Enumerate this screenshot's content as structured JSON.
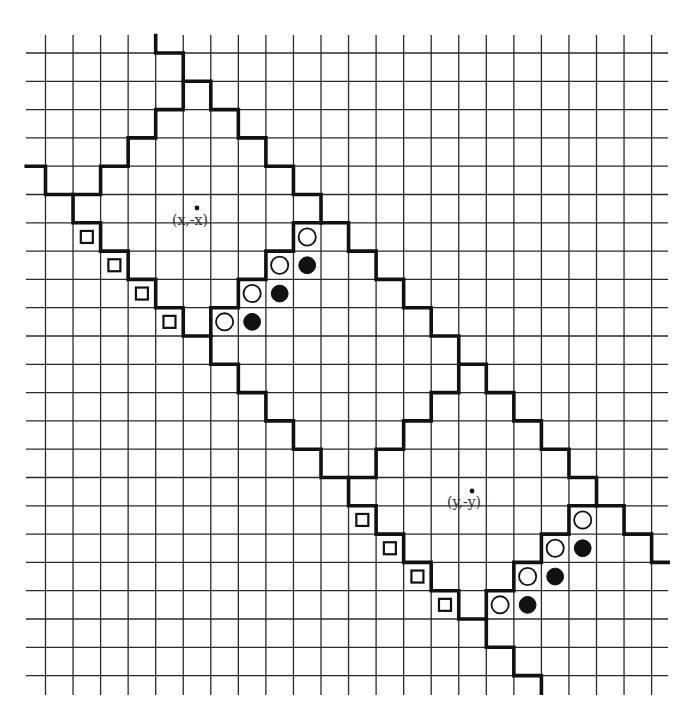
{
  "figure": {
    "colors": {
      "background": "#ffffff",
      "grid": "#2a2a2a",
      "ink": "#111111",
      "label": "#333333"
    },
    "grid": {
      "cols": 23,
      "rows": 23,
      "x0": 45.5,
      "dx": 27.55,
      "y0": 53,
      "dy": 28.3,
      "vertical_line_top": 35,
      "vertical_line_bottom": 695,
      "horizontal_line_left": 26,
      "horizontal_line_right": 668
    },
    "labels": [
      {
        "id": "label-x",
        "text": "(x,-x)",
        "x": 172,
        "y": 225,
        "dot_x": 197,
        "dot_y": 208
      },
      {
        "id": "label-y",
        "text": "(y,-y)",
        "x": 447,
        "y": 507,
        "dot_x": 472,
        "dot_y": 491
      }
    ],
    "thick_paths": [
      {
        "id": "upper-main-staircase",
        "points": [
          [
            4,
            -0.62
          ],
          [
            4,
            0
          ],
          [
            5,
            0
          ],
          [
            5,
            1
          ],
          [
            6,
            1
          ],
          [
            6,
            2
          ],
          [
            7,
            2
          ],
          [
            7,
            3
          ],
          [
            8,
            3
          ],
          [
            8,
            4
          ],
          [
            9,
            4
          ],
          [
            9,
            5
          ],
          [
            10,
            5
          ],
          [
            10,
            6
          ],
          [
            11,
            6
          ],
          [
            11,
            7
          ],
          [
            12,
            7
          ],
          [
            12,
            8
          ],
          [
            13,
            8
          ],
          [
            13,
            9
          ],
          [
            14,
            9
          ],
          [
            14,
            10
          ],
          [
            15,
            10
          ],
          [
            15,
            11
          ],
          [
            16,
            11
          ],
          [
            16,
            12
          ],
          [
            17,
            12
          ],
          [
            17,
            13
          ],
          [
            18,
            13
          ],
          [
            18,
            14
          ],
          [
            19,
            14
          ],
          [
            19,
            15
          ],
          [
            20,
            15
          ],
          [
            20,
            16
          ],
          [
            21,
            16
          ],
          [
            21,
            17
          ],
          [
            22,
            17
          ],
          [
            22,
            18
          ],
          [
            22.6,
            18
          ]
        ]
      },
      {
        "id": "upper-diamond-left-inner",
        "points": [
          [
            5,
            1
          ],
          [
            5,
            2
          ],
          [
            4,
            2
          ],
          [
            4,
            3
          ],
          [
            3,
            3
          ],
          [
            3,
            4
          ],
          [
            2,
            4
          ],
          [
            2,
            5
          ],
          [
            1,
            5
          ]
        ]
      },
      {
        "id": "lower-main-staircase",
        "points": [
          [
            -0.7,
            4
          ],
          [
            0,
            4
          ],
          [
            0,
            5
          ],
          [
            1,
            5
          ],
          [
            1,
            6
          ],
          [
            2,
            6
          ],
          [
            2,
            7
          ],
          [
            3,
            7
          ],
          [
            3,
            8
          ],
          [
            4,
            8
          ],
          [
            4,
            9
          ],
          [
            5,
            9
          ],
          [
            5,
            10
          ],
          [
            6,
            10
          ],
          [
            6,
            11
          ],
          [
            7,
            11
          ],
          [
            7,
            12
          ],
          [
            8,
            12
          ],
          [
            8,
            13
          ],
          [
            9,
            13
          ],
          [
            9,
            14
          ],
          [
            10,
            14
          ],
          [
            10,
            15
          ],
          [
            11,
            15
          ],
          [
            11,
            16
          ],
          [
            12,
            16
          ],
          [
            12,
            17
          ],
          [
            13,
            17
          ],
          [
            13,
            18
          ],
          [
            14,
            18
          ],
          [
            14,
            19
          ],
          [
            15,
            19
          ],
          [
            15,
            20
          ],
          [
            16,
            20
          ],
          [
            16,
            21
          ],
          [
            17,
            21
          ],
          [
            17,
            22
          ],
          [
            18,
            22
          ],
          [
            18,
            22.62
          ]
        ]
      },
      {
        "id": "upper-diamond-right-inner",
        "points": [
          [
            10,
            6
          ],
          [
            9,
            6
          ],
          [
            9,
            7
          ],
          [
            8,
            7
          ],
          [
            8,
            8
          ],
          [
            7,
            8
          ],
          [
            7,
            9
          ],
          [
            6,
            9
          ],
          [
            6,
            10
          ]
        ]
      },
      {
        "id": "lower-diamond-left-inner",
        "points": [
          [
            15,
            11
          ],
          [
            15,
            12
          ],
          [
            14,
            12
          ],
          [
            14,
            13
          ],
          [
            13,
            13
          ],
          [
            13,
            14
          ],
          [
            12,
            14
          ],
          [
            12,
            15
          ],
          [
            11,
            15
          ]
        ]
      },
      {
        "id": "lower-diamond-right-inner",
        "points": [
          [
            20,
            16
          ],
          [
            19,
            16
          ],
          [
            19,
            17
          ],
          [
            18,
            17
          ],
          [
            18,
            18
          ],
          [
            17,
            18
          ],
          [
            17,
            19
          ],
          [
            16,
            19
          ],
          [
            16,
            20
          ]
        ]
      }
    ],
    "markers": {
      "squares": [
        [
          1,
          6
        ],
        [
          2,
          7
        ],
        [
          3,
          8
        ],
        [
          4,
          9
        ],
        [
          11,
          16
        ],
        [
          12,
          17
        ],
        [
          13,
          18
        ],
        [
          14,
          19
        ]
      ],
      "open_circles": [
        [
          9,
          6
        ],
        [
          8,
          7
        ],
        [
          7,
          8
        ],
        [
          6,
          9
        ],
        [
          19,
          16
        ],
        [
          18,
          17
        ],
        [
          17,
          18
        ],
        [
          16,
          19
        ]
      ],
      "filled_circles": [
        [
          9,
          7
        ],
        [
          8,
          8
        ],
        [
          7,
          9
        ],
        [
          19,
          17
        ],
        [
          18,
          18
        ],
        [
          17,
          19
        ]
      ]
    },
    "marker_sizes": {
      "square": 12,
      "open_circle_r": 8.6,
      "filled_circle_r": 8.4
    }
  }
}
